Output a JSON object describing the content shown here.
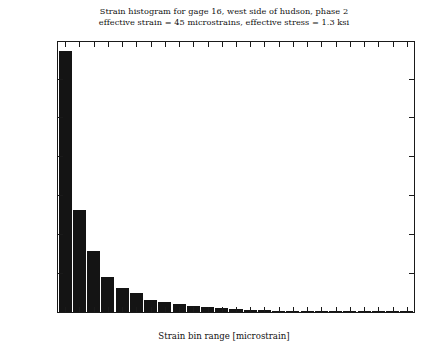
{
  "figure": {
    "title_lines": [
      "Strain histogram for gage 16, west side of hudson, phase 2",
      "effective strain = 45 microstrains, effective stress = 1.3 ksi"
    ],
    "background_color": "#ffffff",
    "bar_color": "#141414",
    "axis_color": "#1a1a1a"
  },
  "chart_data": {
    "type": "bar",
    "title": "Strain histogram for gage 16, west side of hudson, phase 2\neffective strain = 45 microstrains, effective stress = 1.3 ksi",
    "xlabel": "Strain bin range [microstrain]",
    "ylabel": "Number of cycles within 48 hours",
    "categories": [
      "20",
      "28",
      "36",
      "44",
      "52",
      "60",
      "68",
      "76",
      "84",
      "92",
      "100",
      "108",
      "116",
      "124",
      "132",
      "140",
      "148",
      "156",
      "164",
      "172",
      "180",
      "188",
      "196",
      "204",
      "212"
    ],
    "values": [
      6700,
      2630,
      1580,
      890,
      610,
      490,
      300,
      270,
      200,
      150,
      130,
      110,
      90,
      60,
      40,
      25,
      15,
      12,
      10,
      8,
      6,
      5,
      4,
      3,
      2
    ],
    "xtick_labels": [
      "20",
      "28",
      "36",
      "44",
      "52",
      "60",
      "68",
      "76",
      "84",
      "92",
      "100",
      "108",
      "116",
      "124",
      "132",
      "140",
      "148",
      "156",
      "164",
      "172",
      "180",
      "188",
      "196",
      "204",
      "212"
    ],
    "ytick_labels": [
      "0",
      "1000",
      "2000",
      "3000",
      "4000",
      "5000",
      "6000"
    ],
    "ytick_values": [
      0,
      1000,
      2000,
      3000,
      4000,
      5000,
      6000
    ],
    "xlim": [
      16,
      216
    ],
    "ylim": [
      0,
      6940
    ],
    "grid": false,
    "legend": false,
    "bin_width": 8
  }
}
